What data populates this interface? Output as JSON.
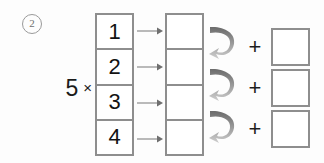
{
  "worksheet": {
    "problem_number": "②",
    "problem_number_plain": "2",
    "multiplier": {
      "factor": "5",
      "operator": "×"
    },
    "left_column": {
      "label": "multiplicand-digits",
      "cells": [
        {
          "value": "1"
        },
        {
          "value": "2"
        },
        {
          "value": "3"
        },
        {
          "value": "4"
        }
      ]
    },
    "arrows": {
      "straight": [
        {
          "name": "arrow-row-1",
          "glyph": "→"
        },
        {
          "name": "arrow-row-2",
          "glyph": "→"
        },
        {
          "name": "arrow-row-3",
          "glyph": "→"
        },
        {
          "name": "arrow-row-4",
          "glyph": "→"
        }
      ],
      "curved": [
        {
          "name": "carry-arrow-1",
          "glyph": "↷"
        },
        {
          "name": "carry-arrow-2",
          "glyph": "↷"
        },
        {
          "name": "carry-arrow-3",
          "glyph": "↷"
        }
      ]
    },
    "middle_column": {
      "label": "partial-products",
      "cells": [
        {
          "value": ""
        },
        {
          "value": ""
        },
        {
          "value": ""
        },
        {
          "value": ""
        }
      ]
    },
    "plus_signs": [
      {
        "glyph": "+"
      },
      {
        "glyph": "+"
      },
      {
        "glyph": "+"
      }
    ],
    "right_column": {
      "label": "sum-boxes",
      "cells": [
        {
          "value": ""
        },
        {
          "value": ""
        },
        {
          "value": ""
        }
      ]
    },
    "colors": {
      "background": "#fdfdfd",
      "box_border": "#8e8e8e",
      "digit_text": "#131313",
      "marker_gray": "#6f6f6f",
      "arrow_dark": "#6e6e6e",
      "arrow_light": "#c6c6c6",
      "thin_arrow": "#8d8d8d"
    }
  }
}
